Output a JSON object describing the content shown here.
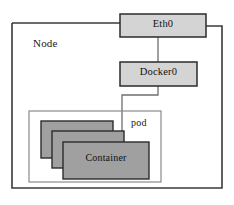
{
  "diagram": {
    "type": "block-diagram",
    "background_color": "#ffffff",
    "stroke_color": "#3a3a3a",
    "box_fill": "#d4d4d4",
    "container_fill": "#a0a0a0",
    "nodes": {
      "node": {
        "label": "Node",
        "shape": "rectangle",
        "fill": "none",
        "x": 12,
        "y": 22,
        "width": 210,
        "height": 166
      },
      "eth0": {
        "label": "Eth0",
        "shape": "rectangle",
        "fill": "#d4d4d4",
        "x": 120,
        "y": 14,
        "width": 86,
        "height": 23
      },
      "docker0": {
        "label": "Docker0",
        "shape": "rectangle",
        "fill": "#d4d4d4",
        "x": 120,
        "y": 62,
        "width": 77,
        "height": 24
      },
      "pod": {
        "label": "pod",
        "shape": "rectangle",
        "fill": "none",
        "x": 29,
        "y": 111,
        "width": 132,
        "height": 71
      },
      "container_back": {
        "label": "",
        "shape": "rectangle",
        "fill": "#a0a0a0",
        "x": 41,
        "y": 121,
        "width": 72,
        "height": 37
      },
      "container_middle": {
        "label": "",
        "shape": "rectangle",
        "fill": "#a0a0a0",
        "x": 52,
        "y": 131,
        "width": 72,
        "height": 37
      },
      "container_front": {
        "label": "Container",
        "shape": "rectangle",
        "fill": "#a0a0a0",
        "x": 63,
        "y": 142,
        "width": 86,
        "height": 37
      }
    },
    "edges": [
      {
        "name": "node-to-eth0-left",
        "from": "node",
        "to": "eth0",
        "style": "orthogonal"
      },
      {
        "name": "eth0-to-node-right",
        "from": "eth0",
        "to": "node",
        "style": "orthogonal"
      },
      {
        "name": "eth0-to-docker0",
        "from": "eth0",
        "to": "docker0",
        "style": "straight"
      },
      {
        "name": "docker0-to-container",
        "from": "docker0",
        "to": "container_front",
        "style": "orthogonal"
      }
    ]
  }
}
